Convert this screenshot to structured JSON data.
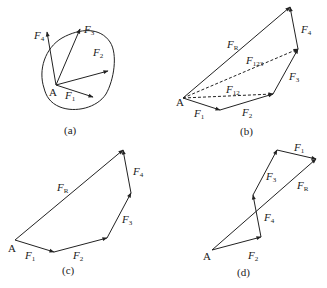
{
  "figure": {
    "panels": [
      {
        "id": "a",
        "caption": "(a)",
        "point": "A",
        "description": "Concurrent forces F1-F4 acting at point A on a rigid body",
        "forces": [
          {
            "name": "F",
            "sub": "1"
          },
          {
            "name": "F",
            "sub": "2"
          },
          {
            "name": "F",
            "sub": "3"
          },
          {
            "name": "F",
            "sub": "4"
          }
        ]
      },
      {
        "id": "b",
        "caption": "(b)",
        "point": "A",
        "description": "Force polygon with intermediate resultants F12 and F123",
        "forces": [
          {
            "name": "F",
            "sub": "1"
          },
          {
            "name": "F",
            "sub": "2"
          },
          {
            "name": "F",
            "sub": "3"
          },
          {
            "name": "F",
            "sub": "4"
          },
          {
            "name": "F",
            "sub": "R"
          },
          {
            "name": "F",
            "sub": "12"
          },
          {
            "name": "F",
            "sub": "123"
          }
        ]
      },
      {
        "id": "c",
        "caption": "(c)",
        "point": "A",
        "description": "Force polygon, order F1, F2, F3, F4 with resultant FR",
        "forces": [
          {
            "name": "F",
            "sub": "1"
          },
          {
            "name": "F",
            "sub": "2"
          },
          {
            "name": "F",
            "sub": "3"
          },
          {
            "name": "F",
            "sub": "4"
          },
          {
            "name": "F",
            "sub": "R"
          }
        ]
      },
      {
        "id": "d",
        "caption": "(d)",
        "point": "A",
        "description": "Force polygon, order F2, F4, F3, F1 with same resultant FR",
        "forces": [
          {
            "name": "F",
            "sub": "2"
          },
          {
            "name": "F",
            "sub": "4"
          },
          {
            "name": "F",
            "sub": "3"
          },
          {
            "name": "F",
            "sub": "1"
          },
          {
            "name": "F",
            "sub": "R"
          }
        ]
      }
    ]
  }
}
